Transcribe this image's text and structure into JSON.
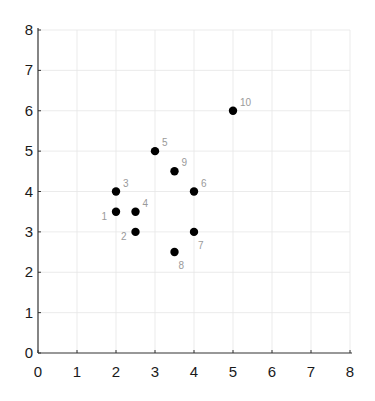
{
  "chart_data": {
    "type": "scatter",
    "title": "",
    "xlabel": "",
    "ylabel": "",
    "xlim": [
      0,
      8
    ],
    "ylim": [
      0,
      8
    ],
    "grid": true,
    "legend": null,
    "x_ticks": [
      "0",
      "1",
      "2",
      "3",
      "4",
      "5",
      "6",
      "7",
      "8"
    ],
    "y_ticks": [
      "0",
      "1",
      "2",
      "3",
      "4",
      "5",
      "6",
      "7",
      "8"
    ],
    "marker_color": "#000000",
    "label_color": "#9a9a9a",
    "points": [
      {
        "label": "1",
        "x": 2.0,
        "y": 3.5,
        "label_pos": "left-below"
      },
      {
        "label": "2",
        "x": 2.5,
        "y": 3.0,
        "label_pos": "left-below"
      },
      {
        "label": "3",
        "x": 2.0,
        "y": 4.0,
        "label_pos": "right-above"
      },
      {
        "label": "4",
        "x": 2.5,
        "y": 3.5,
        "label_pos": "right-above"
      },
      {
        "label": "5",
        "x": 3.0,
        "y": 5.0,
        "label_pos": "right-above"
      },
      {
        "label": "6",
        "x": 4.0,
        "y": 4.0,
        "label_pos": "right-above"
      },
      {
        "label": "7",
        "x": 4.0,
        "y": 3.0,
        "label_pos": "right-below"
      },
      {
        "label": "8",
        "x": 3.5,
        "y": 2.5,
        "label_pos": "right-below"
      },
      {
        "label": "9",
        "x": 3.5,
        "y": 4.5,
        "label_pos": "right-above"
      },
      {
        "label": "10",
        "x": 5.0,
        "y": 6.0,
        "label_pos": "right-above"
      }
    ]
  }
}
